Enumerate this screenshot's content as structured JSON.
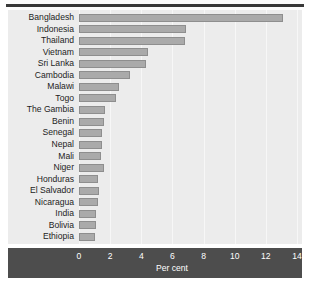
{
  "chart_data": {
    "type": "bar",
    "orientation": "horizontal",
    "title": "",
    "xlabel": "Per cent",
    "ylabel": "",
    "xlim": [
      0,
      14
    ],
    "xticks": [
      0,
      2,
      4,
      6,
      8,
      10,
      12,
      14
    ],
    "grid": true,
    "legend": null,
    "categories": [
      "Bangladesh",
      "Indonesia",
      "Thailand",
      "Vietnam",
      "Sri Lanka",
      "Cambodia",
      "Malawi",
      "Togo",
      "The Gambia",
      "Benin",
      "Senegal",
      "Nepal",
      "Mali",
      "Niger",
      "Honduras",
      "El Salvador",
      "Nicaragua",
      "India",
      "Bolivia",
      "Ethiopia"
    ],
    "values": [
      13.1,
      6.9,
      6.8,
      4.4,
      4.3,
      3.3,
      2.6,
      2.4,
      1.7,
      1.6,
      1.5,
      1.5,
      1.4,
      1.6,
      1.2,
      1.3,
      1.2,
      1.1,
      1.1,
      1.0
    ],
    "bar_color": "#aaaaaa",
    "bar_edge_color": "#8e8e8e",
    "plot_background": "#ececec",
    "axis_band_color": "#4d4d4d",
    "axis_text_color": "#ffffff",
    "label_color": "#1d1d1d"
  }
}
